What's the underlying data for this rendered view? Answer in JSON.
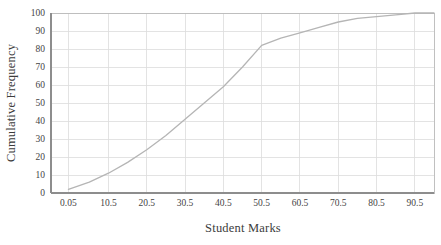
{
  "chart_data": {
    "type": "line",
    "title": "",
    "subtitle": "",
    "xlabel": "Student Marks",
    "ylabel": "Cumulative Frequency",
    "xlim": [
      -4.5,
      95.5
    ],
    "ylim": [
      0,
      100
    ],
    "grid": true,
    "legend": false,
    "legend_position": "none",
    "line_color": "#b5b5b5",
    "x_tick_labels": [
      "0.05",
      "10.5",
      "20.5",
      "30.5",
      "40.5",
      "50.5",
      "60.5",
      "70.5",
      "80.5",
      "90.5"
    ],
    "x_tick_values": [
      0.05,
      10.5,
      20.5,
      30.5,
      40.5,
      50.5,
      60.5,
      70.5,
      80.5,
      90.5
    ],
    "y_tick_labels": [
      "0",
      "10",
      "20",
      "30",
      "40",
      "50",
      "60",
      "70",
      "80",
      "90",
      "100"
    ],
    "y_tick_values": [
      0,
      10,
      20,
      30,
      40,
      50,
      60,
      70,
      80,
      90,
      100
    ],
    "series": [
      {
        "name": "Cumulative Frequency",
        "x": [
          0.05,
          5.5,
          10.5,
          15.5,
          20.5,
          25.5,
          30.5,
          35.5,
          40.5,
          45.5,
          50.5,
          55.5,
          60.5,
          65.5,
          70.5,
          75.5,
          80.5,
          85.5,
          90.5,
          95.5
        ],
        "values": [
          2,
          6,
          11,
          17,
          24,
          32,
          41,
          50,
          59,
          70,
          82,
          86,
          89,
          92,
          95,
          97,
          98,
          99,
          100,
          100
        ]
      }
    ]
  },
  "axes": {
    "x_title": "Student Marks",
    "y_title": "Cumulative Frequency"
  }
}
